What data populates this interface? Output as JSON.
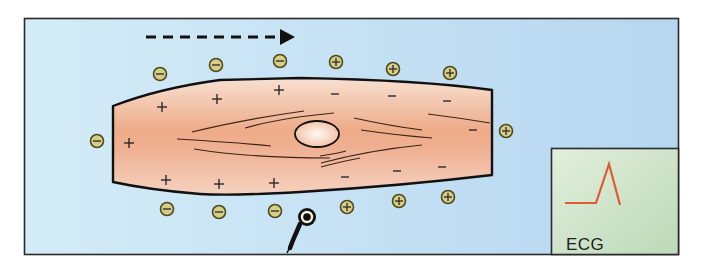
{
  "figure": {
    "colors": {
      "background_fill": "#c6e1f3",
      "frame_stroke": "#222222",
      "cell_fill_edge": "#f5d9c8",
      "cell_fill_center": "#eea987",
      "cell_stroke": "#111111",
      "ion_fill": "#d9cd83",
      "ion_stroke": "#5a5220",
      "ecg_panel_fill": "#cfe4cb",
      "ecg_trace": "#e05a35",
      "arrow": "#111111"
    },
    "direction_arrow": {
      "label": "depolarization-direction",
      "x1": 146,
      "x2": 294,
      "y": 37
    },
    "extracellular_ions": [
      {
        "charge": "-",
        "x": 160,
        "y": 74
      },
      {
        "charge": "-",
        "x": 216,
        "y": 65
      },
      {
        "charge": "-",
        "x": 280,
        "y": 61
      },
      {
        "charge": "+",
        "x": 336,
        "y": 62
      },
      {
        "charge": "+",
        "x": 393,
        "y": 69
      },
      {
        "charge": "+",
        "x": 450,
        "y": 73
      },
      {
        "charge": "-",
        "x": 97,
        "y": 141
      },
      {
        "charge": "+",
        "x": 506,
        "y": 131
      },
      {
        "charge": "-",
        "x": 167,
        "y": 209
      },
      {
        "charge": "-",
        "x": 219,
        "y": 212
      },
      {
        "charge": "-",
        "x": 275,
        "y": 211
      },
      {
        "charge": "+",
        "x": 347,
        "y": 207
      },
      {
        "charge": "+",
        "x": 399,
        "y": 201
      },
      {
        "charge": "+",
        "x": 448,
        "y": 197
      }
    ],
    "intracellular_charges": [
      {
        "sign": "+",
        "x": 129,
        "y": 143
      },
      {
        "sign": "+",
        "x": 162,
        "y": 107
      },
      {
        "sign": "+",
        "x": 217,
        "y": 99
      },
      {
        "sign": "+",
        "x": 279,
        "y": 90
      },
      {
        "sign": "+",
        "x": 166,
        "y": 180
      },
      {
        "sign": "+",
        "x": 219,
        "y": 184
      },
      {
        "sign": "+",
        "x": 274,
        "y": 183
      },
      {
        "sign": "−",
        "x": 335,
        "y": 94
      },
      {
        "sign": "−",
        "x": 392,
        "y": 96
      },
      {
        "sign": "−",
        "x": 447,
        "y": 101
      },
      {
        "sign": "−",
        "x": 473,
        "y": 130
      },
      {
        "sign": "−",
        "x": 345,
        "y": 177
      },
      {
        "sign": "−",
        "x": 397,
        "y": 171
      },
      {
        "sign": "−",
        "x": 442,
        "y": 167
      }
    ],
    "electrode": {
      "x": 307,
      "y": 217
    },
    "ecg_panel": {
      "label": "ECG",
      "trace": "baseline then upward spike (positive deflection)"
    }
  }
}
